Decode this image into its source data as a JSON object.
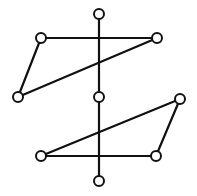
{
  "diagram": {
    "type": "graph",
    "width": 197,
    "height": 196,
    "colors": {
      "stroke": "#111111",
      "node_fill": "#ffffff",
      "background": "#ffffff"
    },
    "node_radius": 5,
    "nodes": [
      {
        "id": "top",
        "x": 99,
        "y": 14
      },
      {
        "id": "upper-left",
        "x": 41,
        "y": 38
      },
      {
        "id": "upper-right",
        "x": 157,
        "y": 38
      },
      {
        "id": "left",
        "x": 18,
        "y": 97
      },
      {
        "id": "center",
        "x": 99,
        "y": 97
      },
      {
        "id": "right",
        "x": 180,
        "y": 99
      },
      {
        "id": "lower-left",
        "x": 41,
        "y": 156
      },
      {
        "id": "lower-right",
        "x": 156,
        "y": 156
      },
      {
        "id": "bottom",
        "x": 99,
        "y": 181
      }
    ],
    "edges": [
      {
        "from": "top",
        "to": "center"
      },
      {
        "from": "center",
        "to": "bottom"
      },
      {
        "from": "upper-left",
        "to": "upper-right"
      },
      {
        "from": "upper-left",
        "to": "left"
      },
      {
        "from": "left",
        "to": "upper-right"
      },
      {
        "from": "right",
        "to": "lower-left"
      },
      {
        "from": "right",
        "to": "lower-right"
      },
      {
        "from": "lower-left",
        "to": "lower-right"
      }
    ]
  }
}
